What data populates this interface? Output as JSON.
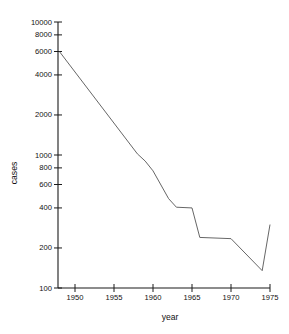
{
  "chart_data": {
    "type": "line",
    "title": "",
    "xlabel": "year",
    "ylabel": "cases",
    "yscale": "log",
    "xlim": [
      1948,
      1975
    ],
    "ylim": [
      100,
      10000
    ],
    "grid": false,
    "legend": "none",
    "y_ticks": [
      {
        "value": 10000,
        "label": "10000"
      },
      {
        "value": 8000,
        "label": "8000"
      },
      {
        "value": 6000,
        "label": "6000"
      },
      {
        "value": 4000,
        "label": "4000"
      },
      {
        "value": 2000,
        "label": "2000"
      },
      {
        "value": 1000,
        "label": "1000"
      },
      {
        "value": 800,
        "label": "800"
      },
      {
        "value": 600,
        "label": "600"
      },
      {
        "value": 400,
        "label": "400"
      },
      {
        "value": 200,
        "label": "200"
      },
      {
        "value": 100,
        "label": "100"
      }
    ],
    "x_ticks": [
      {
        "value": 1950,
        "label": "1950"
      },
      {
        "value": 1955,
        "label": "1955"
      },
      {
        "value": 1960,
        "label": "1960"
      },
      {
        "value": 1965,
        "label": "1965"
      },
      {
        "value": 1970,
        "label": "1970"
      },
      {
        "value": 1975,
        "label": "1975"
      }
    ],
    "series": [
      {
        "name": "cases",
        "color": "#555555",
        "x": [
          1948,
          1958,
          1959,
          1960,
          1962,
          1963,
          1965,
          1966,
          1970,
          1974,
          1975
        ],
        "values": [
          6000,
          1020,
          900,
          760,
          470,
          405,
          400,
          240,
          235,
          135,
          300
        ]
      }
    ]
  }
}
